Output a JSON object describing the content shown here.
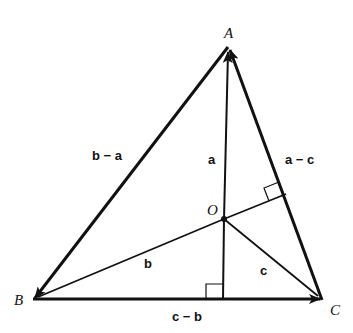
{
  "diagram": {
    "type": "vector triangle with orthocenter",
    "background": "#ffffff",
    "stroke_color": "#111111",
    "points": {
      "A": {
        "label": "A",
        "x": 228,
        "y": 47
      },
      "B": {
        "label": "B",
        "x": 33,
        "y": 300
      },
      "C": {
        "label": "C",
        "x": 322,
        "y": 300
      },
      "O": {
        "label": "O",
        "x": 224,
        "y": 219
      }
    },
    "vectors": [
      {
        "id": "a",
        "label": "a",
        "from": "O",
        "to": "A"
      },
      {
        "id": "b",
        "label": "b",
        "from": "O",
        "to": "B"
      },
      {
        "id": "c",
        "label": "c",
        "from": "O",
        "to": "C"
      },
      {
        "id": "b-a",
        "label": "b − a",
        "from": "A",
        "to": "B"
      },
      {
        "id": "a-c",
        "label": "a − c",
        "from": "C",
        "to": "A"
      },
      {
        "id": "c-b",
        "label": "c − b",
        "from": "B",
        "to": "C"
      }
    ],
    "right_angle_marks": [
      {
        "at": "foot of altitude from O on AC"
      },
      {
        "at": "foot of altitude from A on BC"
      }
    ]
  }
}
